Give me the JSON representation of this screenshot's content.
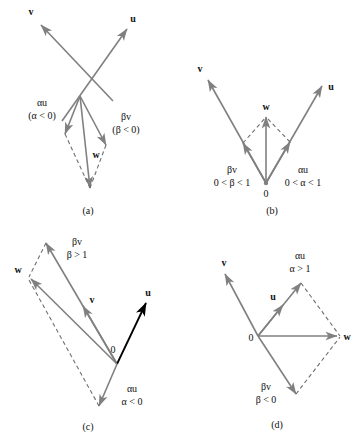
{
  "figure": {
    "background_color": "#ffffff",
    "vector_color": "#808080",
    "emphasis_vector_color": "#000000",
    "dashed_color": "#6e6e6e",
    "text_color": "#111111"
  },
  "panels": [
    {
      "id": "a",
      "caption": "(a)",
      "labels": {
        "v": "v",
        "u": "u",
        "w": "w",
        "alpha_u": "αu",
        "alpha_cond": "(α < 0)",
        "beta_v": "βv",
        "beta_cond": "(β < 0)"
      }
    },
    {
      "id": "b",
      "caption": "(b)",
      "labels": {
        "v": "v",
        "u": "u",
        "w": "w",
        "origin": "0",
        "beta_v": "βv",
        "beta_cond": "0 < β < 1",
        "alpha_u": "αu",
        "alpha_cond": "0 < α < 1"
      }
    },
    {
      "id": "c",
      "caption": "(c)",
      "labels": {
        "v": "v",
        "u": "u",
        "w": "w",
        "origin": "0",
        "beta_v": "βv",
        "beta_cond": "β > 1",
        "alpha_u": "αu",
        "alpha_cond": "α < 0"
      }
    },
    {
      "id": "d",
      "caption": "(d)",
      "labels": {
        "v": "v",
        "u": "u",
        "w": "w",
        "origin": "0",
        "alpha_u": "αu",
        "alpha_cond": "α > 1",
        "beta_v": "βv",
        "beta_cond": "β < 0"
      }
    }
  ]
}
